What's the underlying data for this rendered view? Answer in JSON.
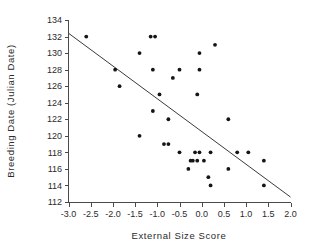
{
  "chart_data": {
    "type": "scatter",
    "title": "",
    "xlabel": "External Size Score",
    "ylabel": "Breeding Date (Julian Date)",
    "xlim": [
      -3.0,
      2.0
    ],
    "ylim": [
      112,
      134
    ],
    "xticks": [
      -3.0,
      -2.5,
      -2.0,
      -1.5,
      -1.0,
      -0.5,
      0.0,
      0.5,
      1.0,
      1.5,
      2.0
    ],
    "xticklabels": [
      "-3.0",
      "-2.5",
      "-2.0",
      "-1.5",
      "-1.0",
      "-0.5",
      "0.0",
      "0.5",
      "1.0",
      "1.5",
      "2.0"
    ],
    "yticks": [
      112,
      114,
      116,
      118,
      120,
      122,
      124,
      126,
      128,
      130,
      132,
      134
    ],
    "yticklabels": [
      "112",
      "114",
      "116",
      "118",
      "120",
      "122",
      "124",
      "126",
      "128",
      "130",
      "132",
      "134"
    ],
    "grid": false,
    "legend": null,
    "points": [
      {
        "x": -2.6,
        "y": 132
      },
      {
        "x": -1.15,
        "y": 132
      },
      {
        "x": -1.05,
        "y": 132
      },
      {
        "x": 0.3,
        "y": 131
      },
      {
        "x": -1.4,
        "y": 130
      },
      {
        "x": -0.05,
        "y": 130
      },
      {
        "x": -1.95,
        "y": 128
      },
      {
        "x": -1.1,
        "y": 128
      },
      {
        "x": -0.5,
        "y": 128
      },
      {
        "x": -0.05,
        "y": 128
      },
      {
        "x": -0.65,
        "y": 127
      },
      {
        "x": -1.85,
        "y": 126
      },
      {
        "x": -0.95,
        "y": 125
      },
      {
        "x": -0.1,
        "y": 125
      },
      {
        "x": -1.1,
        "y": 123
      },
      {
        "x": -0.75,
        "y": 122
      },
      {
        "x": 0.6,
        "y": 122
      },
      {
        "x": -1.4,
        "y": 120
      },
      {
        "x": -0.85,
        "y": 119
      },
      {
        "x": -0.75,
        "y": 119
      },
      {
        "x": -0.5,
        "y": 118
      },
      {
        "x": -0.15,
        "y": 118
      },
      {
        "x": -0.05,
        "y": 118
      },
      {
        "x": 0.2,
        "y": 118
      },
      {
        "x": 0.8,
        "y": 118
      },
      {
        "x": 1.05,
        "y": 118
      },
      {
        "x": -0.25,
        "y": 117
      },
      {
        "x": -0.2,
        "y": 117
      },
      {
        "x": -0.1,
        "y": 117
      },
      {
        "x": 0.05,
        "y": 117
      },
      {
        "x": 1.4,
        "y": 117
      },
      {
        "x": -0.3,
        "y": 116
      },
      {
        "x": 0.6,
        "y": 116
      },
      {
        "x": 0.15,
        "y": 115
      },
      {
        "x": 0.2,
        "y": 114
      },
      {
        "x": 1.4,
        "y": 114
      }
    ],
    "fit_line": {
      "type": "linear-regression",
      "x_start": -3.0,
      "y_start": 132.4,
      "x_end": 2.0,
      "y_end": 112.6
    }
  }
}
